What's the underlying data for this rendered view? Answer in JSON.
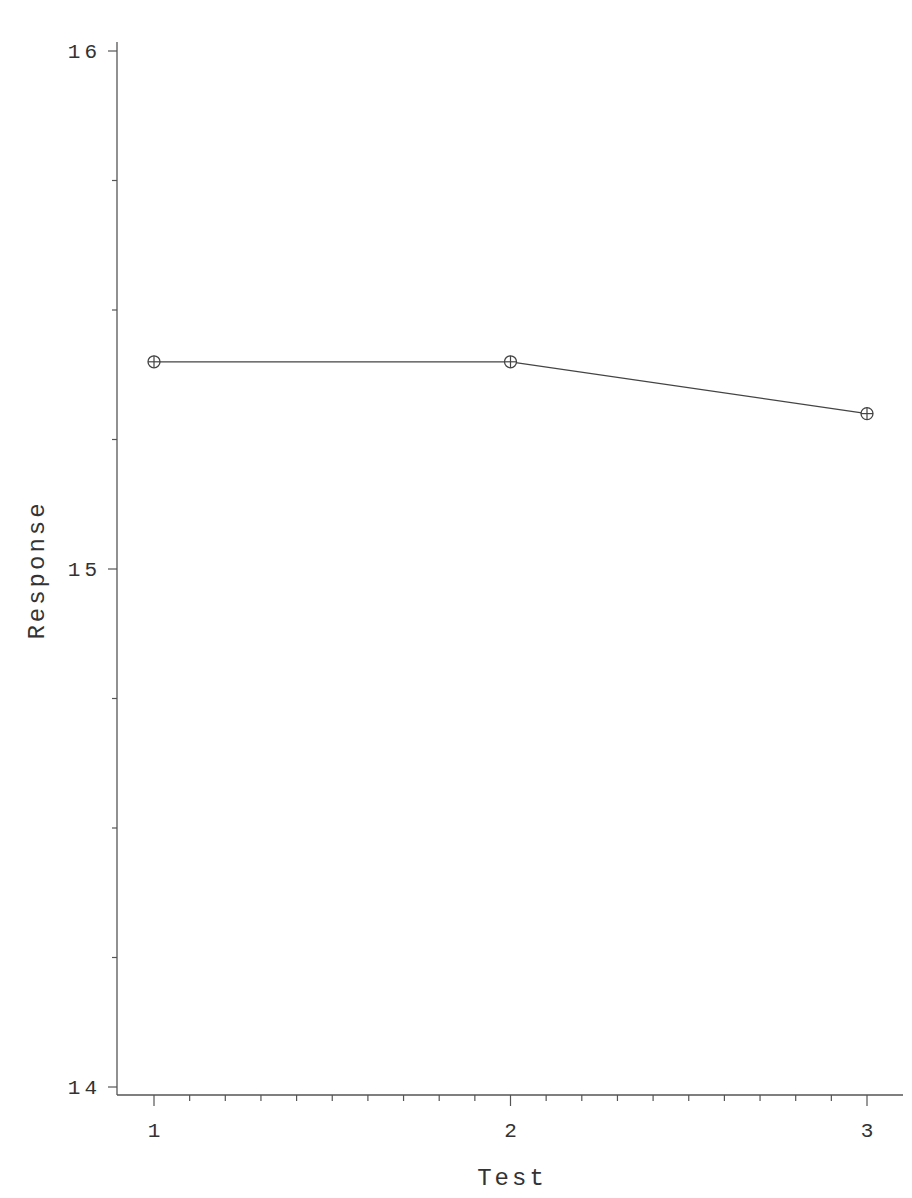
{
  "chart_data": {
    "type": "line",
    "title": "",
    "xlabel": "Test",
    "ylabel": "Response",
    "x": [
      1,
      2,
      3
    ],
    "categories": [
      "1",
      "2",
      "3"
    ],
    "series": [
      {
        "name": "Response",
        "values": [
          15.4,
          15.4,
          15.3
        ],
        "marker": "circle-plus"
      }
    ],
    "xlim": [
      0.9,
      3.1
    ],
    "ylim": [
      14,
      16
    ],
    "x_ticks": [
      "1",
      "2",
      "3"
    ],
    "x_minor_step": 0.1,
    "y_ticks": [
      "14",
      "15",
      "16"
    ],
    "y_minor_step": 0.25,
    "grid": false,
    "legend": "none"
  },
  "colors": {
    "line": "#444444",
    "axis": "#555555",
    "text": "#333333"
  }
}
